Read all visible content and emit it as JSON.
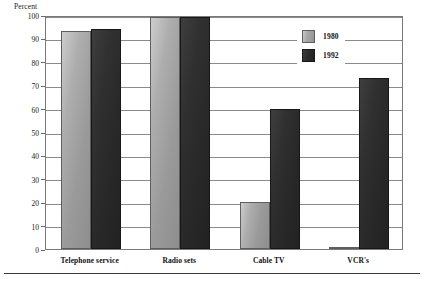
{
  "chart_data": {
    "type": "bar",
    "title": "",
    "subtitle": "",
    "xlabel": "",
    "ylabel": "Percent",
    "ylim": [
      0,
      100
    ],
    "grid": true,
    "legend_position": "inside-top-right",
    "categories": [
      "Telephone service",
      "Radio sets",
      "Cable TV",
      "VCR's"
    ],
    "series": [
      {
        "name": "1980",
        "color": "#a8a8a8",
        "values": [
          93,
          99,
          20,
          1
        ]
      },
      {
        "name": "1992",
        "color": "#2a2a2a",
        "values": [
          94,
          99,
          60,
          73
        ]
      }
    ],
    "y_ticks": [
      0,
      10,
      20,
      30,
      40,
      50,
      60,
      70,
      80,
      90,
      100
    ],
    "y_tick_labels": [
      "0",
      "10",
      "20",
      "30",
      "40",
      "50",
      "60",
      "70",
      "80",
      "90",
      "100"
    ]
  },
  "axes": {
    "y_unit_label": "Percent"
  },
  "legend": {
    "entries": [
      {
        "label": "1980",
        "swatch": "light-gray-swatch"
      },
      {
        "label": "1992",
        "swatch": "dark-swatch"
      }
    ]
  },
  "footer": {
    "caption_fragment": ""
  }
}
